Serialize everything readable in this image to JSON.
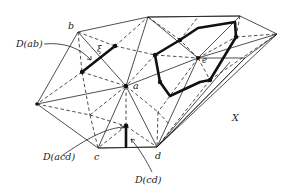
{
  "figure": {
    "type": "Voronoi diagram / Delaunay triangulation illustration",
    "labels": {
      "D_ab": "D(ab)",
      "D_acd": "D(acd)",
      "D_cd": "D(cd)",
      "b": "b",
      "a": "a",
      "c": "c",
      "d": "d",
      "e": "e",
      "xi": "ξ",
      "X": "X"
    },
    "vertices": {
      "b": [
        78,
        32
      ],
      "a": [
        126,
        86
      ],
      "c": [
        98,
        148
      ],
      "d": [
        157,
        147
      ],
      "e": [
        198,
        58
      ],
      "top1": [
        148,
        17
      ],
      "top2": [
        240,
        16
      ],
      "right": [
        277,
        34
      ],
      "left": [
        37,
        104
      ]
    },
    "legend_notes": {
      "solid_thin": "triangulation edges",
      "dashed": "dual / Voronoi edges",
      "thick": "highlighted dual cells D(·)"
    }
  }
}
